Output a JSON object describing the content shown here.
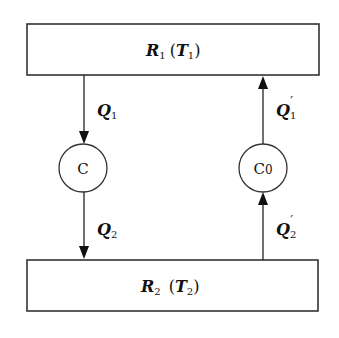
{
  "diagram": {
    "type": "heat-engine-cycle",
    "top_reservoir": {
      "symbol": "R",
      "subscript": "1",
      "temp_symbol": "T",
      "temp_subscript": "1"
    },
    "bottom_reservoir": {
      "symbol": "R",
      "subscript": "2",
      "temp_symbol": "T",
      "temp_subscript": "2"
    },
    "engines": [
      {
        "id": "C",
        "label": "C",
        "subscript": ""
      },
      {
        "id": "C0",
        "label": "C",
        "subscript": "0"
      }
    ],
    "flows": [
      {
        "label": "Q",
        "subscript": "1",
        "prime": "",
        "direction": "down",
        "from": "R1",
        "to": "C"
      },
      {
        "label": "Q",
        "subscript": "2",
        "prime": "",
        "direction": "down",
        "from": "C",
        "to": "R2"
      },
      {
        "label": "Q",
        "subscript": "1",
        "prime": "′",
        "direction": "up",
        "from": "C0",
        "to": "R1"
      },
      {
        "label": "Q",
        "subscript": "2",
        "prime": "′",
        "direction": "up",
        "from": "R2",
        "to": "C0"
      }
    ],
    "colors": {
      "stroke": "#222222",
      "background": "#ffffff"
    }
  }
}
